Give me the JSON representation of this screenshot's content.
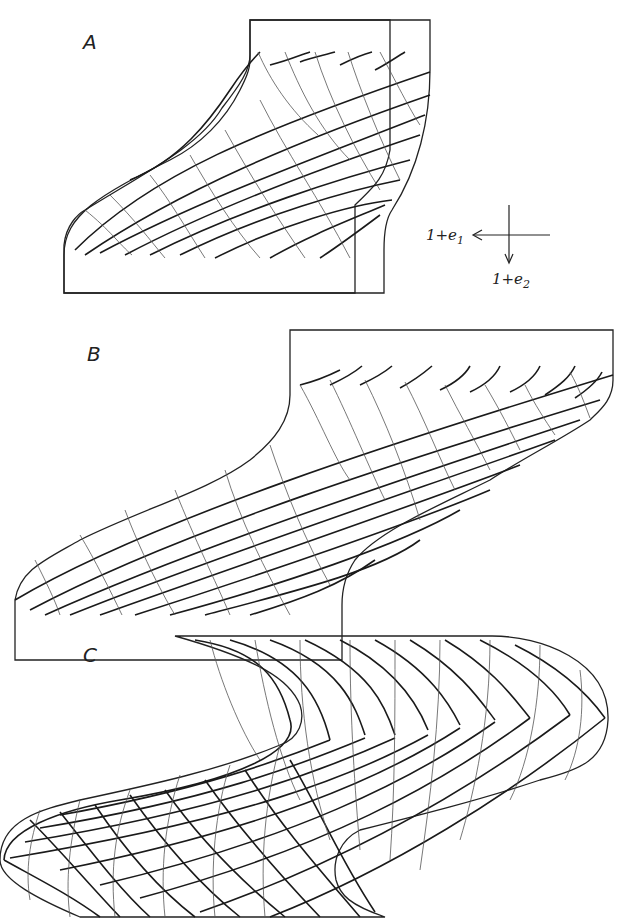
{
  "figure": {
    "panels": [
      {
        "id": "A",
        "label": "A"
      },
      {
        "id": "B",
        "label": "B"
      },
      {
        "id": "C",
        "label": "C"
      }
    ],
    "axes_legend": {
      "horizontal_prefix": "1+e",
      "horizontal_sub": "1",
      "vertical_prefix": "1+e",
      "vertical_sub": "2"
    }
  }
}
